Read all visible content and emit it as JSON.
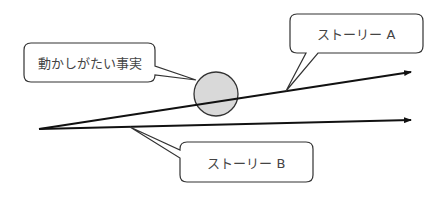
{
  "diagram": {
    "callouts": {
      "fact": {
        "label": "動かしがたい事実"
      },
      "story_a": {
        "label": "ストーリー A"
      },
      "story_b": {
        "label": "ストーリー B"
      }
    },
    "colors": {
      "line": "#111111",
      "circle_fill": "#d9d9d9",
      "circle_stroke": "#333333",
      "box_stroke": "#333333",
      "text": "#444444"
    }
  }
}
